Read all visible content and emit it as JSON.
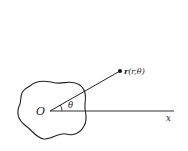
{
  "figure": {
    "origin_label": "O",
    "angle_label": "θ",
    "axis_label": "x",
    "point_label_vector": "r",
    "point_label_args": "(r,θ)",
    "colors": {
      "stroke": "#222222",
      "background": "#ffffff"
    }
  }
}
